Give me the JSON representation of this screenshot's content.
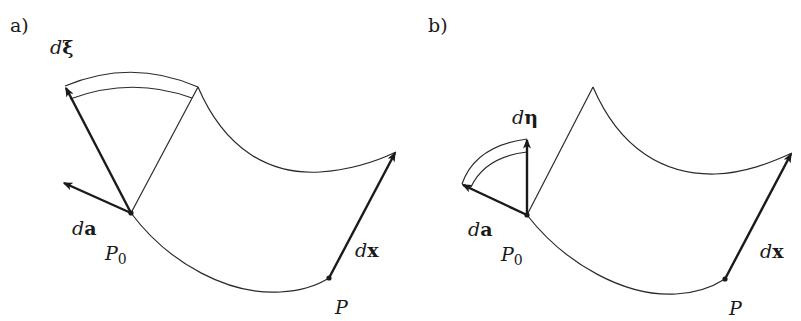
{
  "figure": {
    "panels": [
      {
        "id": "a",
        "label": "a)",
        "vectors": {
          "d_xi": {
            "prefix": "d",
            "symbol": "ξ"
          },
          "d_a": {
            "prefix": "d",
            "symbol": "a"
          },
          "d_x": {
            "prefix": "d",
            "symbol": "x"
          }
        },
        "points": {
          "P0": {
            "base": "P",
            "sub": "0"
          },
          "P": {
            "base": "P"
          }
        }
      },
      {
        "id": "b",
        "label": "b)",
        "vectors": {
          "d_eta": {
            "prefix": "d",
            "symbol": "η"
          },
          "d_a": {
            "prefix": "d",
            "symbol": "a"
          },
          "d_x": {
            "prefix": "d",
            "symbol": "x"
          }
        },
        "points": {
          "P0": {
            "base": "P",
            "sub": "0"
          },
          "P": {
            "base": "P"
          }
        }
      }
    ],
    "colors": {
      "ink": "#1a1a1a",
      "background": "#ffffff"
    }
  }
}
